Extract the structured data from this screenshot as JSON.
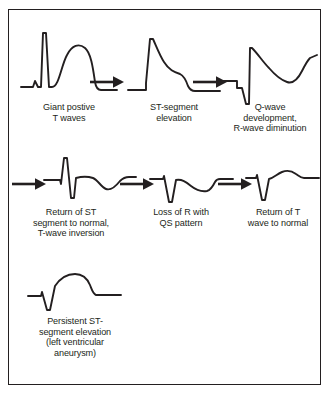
{
  "figure": {
    "background_color": "#ffffff",
    "stroke_color": "#231f20",
    "border_color": "#231f20"
  },
  "stages": [
    {
      "id": "stage-1",
      "order": 1,
      "row": 1,
      "caption_lines": [
        "Giant postive",
        "T waves"
      ],
      "waveform_name": "giant-positive-t-wave-trace",
      "waveform_description": "Baseline, tall narrow R spike, then broad rounded giant upright T wave returning to baseline"
    },
    {
      "id": "stage-2",
      "order": 2,
      "row": 1,
      "caption_lines": [
        "ST-segment",
        "elevation"
      ],
      "waveform_name": "st-elevation-trace",
      "waveform_description": "Sharp R upstroke with coved, slowly descending elevated ST segment back to baseline"
    },
    {
      "id": "stage-3",
      "order": 3,
      "row": 1,
      "caption_lines": [
        "Q-wave",
        "development,",
        "R-wave diminution"
      ],
      "waveform_name": "q-wave-development-trace",
      "waveform_description": "Deep Q wave, diminished R, elevated ST arching down into a negative T trough then rising"
    },
    {
      "id": "stage-4",
      "order": 4,
      "row": 2,
      "caption_lines": [
        "Return of ST",
        "segment to normal,",
        "T-wave inversion"
      ],
      "waveform_name": "t-wave-inversion-trace",
      "waveform_description": "Small R with deep S, ST back at baseline, deep symmetric inverted T wave"
    },
    {
      "id": "stage-5",
      "order": 5,
      "row": 2,
      "caption_lines": [
        "Loss of R with",
        "QS pattern"
      ],
      "waveform_name": "qs-pattern-trace",
      "waveform_description": "QS complex with no R wave, deep narrow Q, followed by broad inverted T wave"
    },
    {
      "id": "stage-6",
      "order": 6,
      "row": 2,
      "caption_lines": [
        "Return of T",
        "wave to normal"
      ],
      "waveform_name": "t-wave-normalization-trace",
      "waveform_description": "Deep Q wave followed by a small upright T wave above baseline"
    },
    {
      "id": "stage-7",
      "order": 7,
      "row": 3,
      "caption_lines": [
        "Persistent ST-",
        "segment elevation",
        "(left ventricular",
        "aneurysm)"
      ],
      "waveform_name": "persistent-st-elevation-trace",
      "waveform_description": "Q wave then persistently elevated domed ST segment remaining above baseline"
    }
  ],
  "arrows": [
    {
      "id": "arrow-1",
      "name": "progression-arrow-1-to-2",
      "glyph": "right-arrow"
    },
    {
      "id": "arrow-2",
      "name": "progression-arrow-2-to-3",
      "glyph": "right-arrow"
    },
    {
      "id": "arrow-3",
      "name": "progression-arrow-3-to-4",
      "glyph": "right-arrow"
    },
    {
      "id": "arrow-4",
      "name": "progression-arrow-4-to-5",
      "glyph": "right-arrow"
    },
    {
      "id": "arrow-5",
      "name": "progression-arrow-5-to-6",
      "glyph": "right-arrow"
    }
  ]
}
